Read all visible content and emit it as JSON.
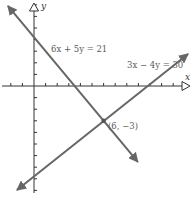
{
  "chart_data": {
    "type": "line",
    "title": "",
    "xlabel": "x",
    "ylabel": "y",
    "grid": false,
    "axes": {
      "origin_px": [
        34,
        86
      ],
      "unit_px": 11.6,
      "x_ticks": [
        -2,
        -1,
        1,
        2,
        3,
        4,
        5,
        6,
        7,
        8,
        9,
        10,
        11,
        12
      ],
      "y_ticks": [
        -9,
        -8,
        -7,
        -6,
        -5,
        -4,
        -3,
        -2,
        -1,
        1,
        2,
        3,
        4,
        5,
        6,
        7
      ],
      "xlim": [
        -2.8,
        13.5
      ],
      "ylim": [
        -9.2,
        7.2
      ]
    },
    "series": [
      {
        "name": "6x + 5y = 21",
        "equation": "6x + 5y = 21",
        "slope": -1.2,
        "y_intercept": 4.2,
        "x_intercept": 3.5,
        "endpoints": [
          [
            -2.25,
            6.9
          ],
          [
            8.95,
            -6.54
          ]
        ],
        "color": "#666666"
      },
      {
        "name": "3x − 4y = 30",
        "equation": "3x − 4y = 30",
        "slope": 0.75,
        "y_intercept": -7.5,
        "x_intercept": 10,
        "endpoints": [
          [
            -1.47,
            -8.97
          ],
          [
            13.28,
            2.76
          ]
        ],
        "color": "#666666"
      }
    ],
    "annotations": [
      {
        "text": "(6, −3)",
        "point": [
          6,
          -3
        ],
        "type": "intersection"
      }
    ]
  },
  "labels": {
    "x_axis": "x",
    "y_axis": "y",
    "eq1": "6x + 5y = 21",
    "eq2": "3x − 4y = 30",
    "intersection": "(6, −3)"
  },
  "colors": {
    "axis": "#333333",
    "line": "#666666",
    "text": "#5a5a5a"
  }
}
